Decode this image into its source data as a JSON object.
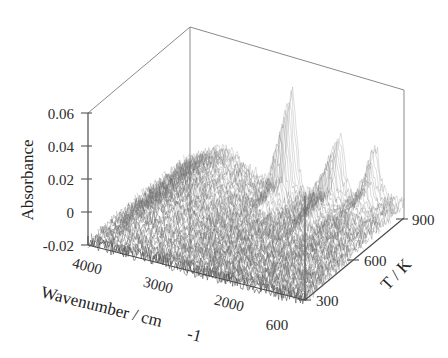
{
  "figure": {
    "background": "#ffffff",
    "line_color": "#8a8a8a",
    "data_color": "#6f6f6f"
  },
  "chart_data": {
    "type": "line",
    "title": "",
    "projection": "3d-waterfall",
    "xlabel": "Wavenumber / cm-1",
    "ylabel": "Absorbance",
    "zlabel": "T / K",
    "xticks": [
      4000,
      3000,
      2000,
      600
    ],
    "xticklabels": [
      "4000",
      "3000",
      "2000",
      "600"
    ],
    "xlim": [
      4000,
      600
    ],
    "yticks": [
      0.06,
      0.04,
      0.02,
      0,
      -0.02
    ],
    "yticklabels": [
      "0.06",
      "0.04",
      "0.02",
      "0",
      "-0.02"
    ],
    "ylim": [
      -0.02,
      0.06
    ],
    "zticks": [
      300,
      600,
      900
    ],
    "zticklabels": [
      "300",
      "600",
      "900"
    ],
    "zlim": [
      300,
      900
    ],
    "grid": false,
    "legend": null,
    "series_count": 60,
    "series_note": "Each trace is one spectrum at a given temperature from 300 K (front) to 900 K (back)",
    "peaks": [
      {
        "wavenumber": 2350,
        "label": "",
        "relative_height": 0.06,
        "temperature_range": [
          700,
          900
        ]
      },
      {
        "wavenumber": 1600,
        "label": "",
        "relative_height": 0.035,
        "temperature_range": [
          600,
          900
        ]
      },
      {
        "wavenumber": 1050,
        "label": "",
        "relative_height": 0.03,
        "temperature_range": [
          750,
          900
        ]
      },
      {
        "wavenumber": 3400,
        "label": "",
        "relative_height": 0.012,
        "temperature_range": [
          300,
          500
        ]
      }
    ],
    "baseline": 0.0,
    "noise_level": 0.004
  },
  "axes": {
    "y": {
      "title": "Absorbance",
      "ticks": [
        "0.06",
        "0.04",
        "0.02",
        "0",
        "-0.02"
      ]
    },
    "x": {
      "title": "Wavenumber / cm",
      "title_sub": "-1",
      "ticks": [
        "4000",
        "3000",
        "2000",
        "600"
      ]
    },
    "z": {
      "title": "T / K",
      "ticks": [
        "300",
        "600",
        "900"
      ]
    }
  }
}
